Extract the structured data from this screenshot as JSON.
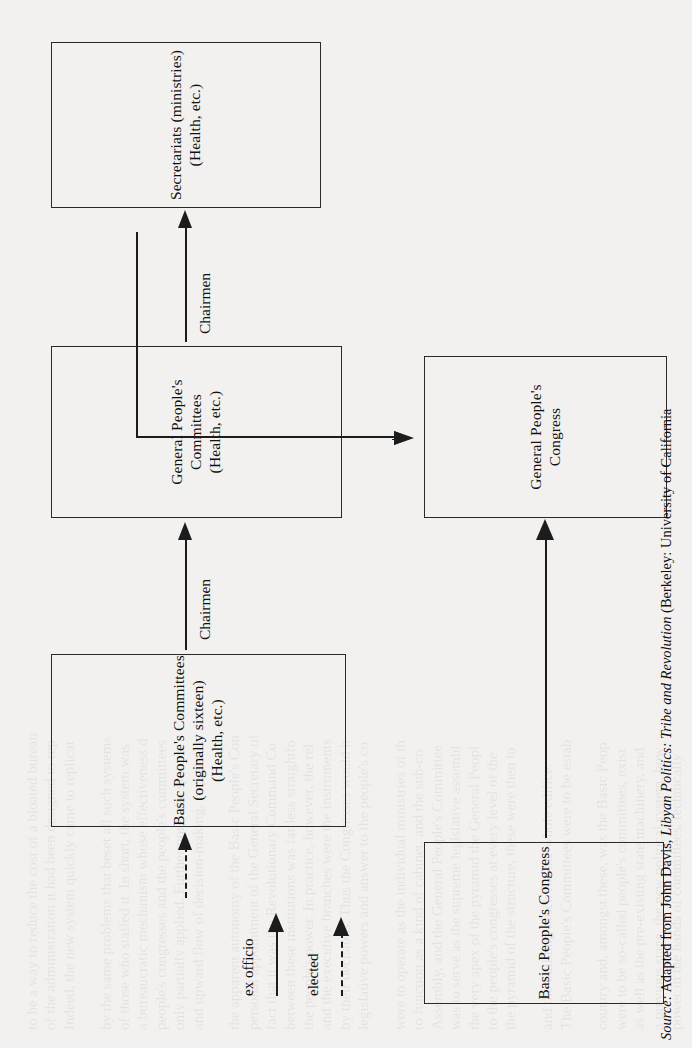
{
  "figure": {
    "type": "organizational-flow-diagram",
    "orientation": "rotated-90-counterclockwise",
    "boxes": [
      {
        "id": "secretariats",
        "lines": [
          "Secretariats (ministries)",
          "(Health, etc.)"
        ]
      },
      {
        "id": "general-peoples-committees",
        "lines": [
          "General People's Committees",
          "(Health, etc.)"
        ]
      },
      {
        "id": "general-peoples-congress",
        "lines": [
          "General People's Congress"
        ]
      },
      {
        "id": "basic-peoples-committees",
        "lines": [
          "Basic People's Committees",
          "(originally sixteen) (Health, etc.)"
        ]
      },
      {
        "id": "basic-peoples-congress",
        "lines": [
          "Basic People's Congress"
        ]
      }
    ],
    "edge_labels": [
      {
        "id": "chairmen-upper",
        "text": "Chairmen"
      },
      {
        "id": "chairmen-lower",
        "text": "Chairmen"
      }
    ],
    "legend": {
      "items": [
        {
          "id": "ex-officio",
          "label": "ex officio",
          "style": "solid-arrow"
        },
        {
          "id": "elected",
          "label": "elected",
          "style": "dashed-arrow"
        }
      ]
    }
  },
  "source": {
    "prefix": "Source:",
    "body_before": " Adapted from John Davis, ",
    "title": "Libyan Politics: Tribe and Revolution",
    "body_after": " (Berkeley: University of California"
  },
  "ghost_text": {
    "lines": [
      "power in the hands of committees, technically",
      "a previous stage, the new political system, how",
      "as well as the pre-existing state machinery, and",
      "were to be so-called people's committees, exist",
      "country and, amongst these, was the Basic Peop",
      "",
      "The Basic People's Committees were to be estab",
      "and the building block for the whole edifice.",
      "",
      "the pyramid of the structure, these were then to",
      "to the people's congresses at every level of the",
      "the very apex of the pyramid the General Peopl",
      "was to serve as the supreme legislative assembl",
      "Assembly, and the General People's Committee",
      "to function as a kind of cabinet, and the sub-co",
      "were to operate as the individual ministries of th",
      "",
      "legislative powers and answer to the people's co",
      "by their decisions. Thus the Congresses would h",
      "and the executive branches were the instruments",
      "the people's power. In practice, however, the rel",
      "between these institutions was far less straightfo",
      "fact that it was the Revolutionary Command Co",
      "personal appointment of the General Secretary of",
      "the apparent autonomy of the Basic People's Con",
      "",
      "and upward flow of decision-making, in practice",
      "only partially applied. Furthermore, the system",
      "people's congresses and the people's committees",
      "a bureaucratic mechanism whose effectiveness d",
      "of those who staffed it. In short, the system was",
      "by the same problems that beset all such systems",
      "",
      "Indeed, the new system quickly came to replicat",
      "of the administration it had been designed to rep",
      "to be a way to reduce the cost of a bloated bureau"
    ]
  }
}
